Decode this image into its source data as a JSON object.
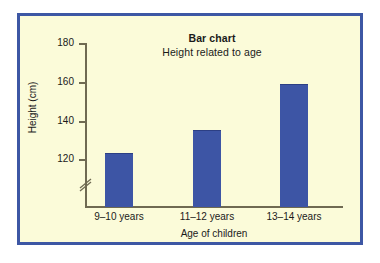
{
  "figure": {
    "frame_color": "#3d57a4",
    "panel_background": "#fbfbd9",
    "page_background": "#ffffff"
  },
  "chart_data": {
    "type": "bar",
    "title": "Bar chart",
    "subtitle": "Height related to age",
    "xlabel": "Age of children",
    "ylabel": "Height (cm)",
    "categories": [
      "9–10 years",
      "11–12 years",
      "13–14 years"
    ],
    "values": [
      123,
      135,
      159
    ],
    "series": [
      {
        "name": "Height",
        "values": [
          123,
          135,
          159
        ]
      }
    ],
    "ylim": [
      120,
      180
    ],
    "yticks": [
      120,
      140,
      160,
      180
    ],
    "ytick_labels": [
      "120",
      "140",
      "160",
      "180"
    ],
    "axis_break": true,
    "axis_break_note": "y-axis broken below 120",
    "grid": false,
    "legend": "none",
    "bar_color": "#3d55a5",
    "axis_color": "#6f6a52",
    "text_color": "#1a1a1a"
  }
}
